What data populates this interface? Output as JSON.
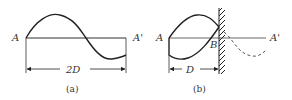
{
  "figures": [
    {
      "id": "a",
      "caption": "(a)",
      "labels": {
        "left": "A",
        "right": "A'"
      },
      "dimension": "2D"
    },
    {
      "id": "b",
      "caption": "(b)",
      "labels": {
        "left": "A",
        "reflection_point": "B",
        "right": "A'"
      },
      "dimension": "D"
    }
  ],
  "colors": {
    "stroke": "#222222",
    "baseline": "#444444",
    "dashed": "#555555"
  }
}
